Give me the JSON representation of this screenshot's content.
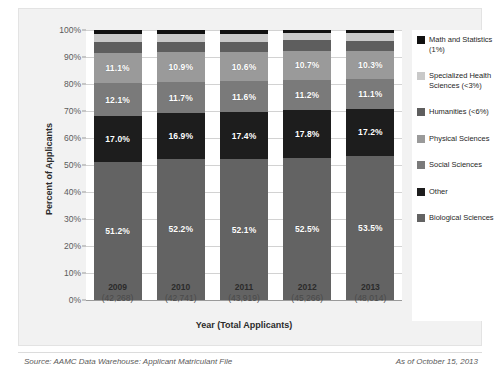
{
  "title_sliver": "",
  "footer": {
    "source": "Source: AAMC Data Warehouse: Applicant Matriculant File",
    "as_of": "As of October 15, 2013"
  },
  "axes": {
    "ylabel": "Percent of Applicants",
    "xlabel": "Year (Total Applicants)",
    "yticks": [
      "100%",
      "90%",
      "80%",
      "70%",
      "60%",
      "50%",
      "40%",
      "30%",
      "20%",
      "10%",
      "0%"
    ]
  },
  "colors": {
    "math_statistics": "#111111",
    "specialized_health_sciences": "#c9c9c9",
    "humanities": "#5e5e5e",
    "physical_sciences": "#9a9a9a",
    "social_sciences": "#7a7a7a",
    "other": "#1d1d1d",
    "biological_sciences": "#636363",
    "plot_background": "#ffffff",
    "panel_background": "#f2f2f2"
  },
  "legend": {
    "items": [
      {
        "label": "Math and Statistics (1%)",
        "color": "#111111",
        "key": "math_statistics"
      },
      {
        "label": "Specialized Health Sciences (<3%)",
        "color": "#c9c9c9",
        "key": "specialized_health_sciences"
      },
      {
        "label": "Humanities (<6%)",
        "color": "#5e5e5e",
        "key": "humanities"
      },
      {
        "label": "Physical Sciences",
        "color": "#9a9a9a",
        "key": "physical_sciences"
      },
      {
        "label": "Social Sciences",
        "color": "#7a7a7a",
        "key": "social_sciences"
      },
      {
        "label": "Other",
        "color": "#1d1d1d",
        "key": "other"
      },
      {
        "label": "Biological Sciences",
        "color": "#636363",
        "key": "biological_sciences"
      }
    ]
  },
  "chart_data": {
    "type": "bar",
    "subtype": "stacked-100-percent",
    "title": "",
    "xlabel": "Year (Total Applicants)",
    "ylabel": "Percent of Applicants",
    "ylim": [
      0,
      100
    ],
    "ytick_step": 10,
    "grid": true,
    "legend_position": "right",
    "categories": [
      "2009",
      "2010",
      "2011",
      "2012",
      "2013"
    ],
    "category_sublabels": [
      "(42,268)",
      "(42,741)",
      "(43,919)",
      "(45,266)",
      "(48,014)"
    ],
    "total_applicants": [
      42268,
      42741,
      43919,
      45266,
      48014
    ],
    "stack_order_bottom_to_top": [
      "Biological Sciences",
      "Other",
      "Social Sciences",
      "Physical Sciences",
      "Humanities",
      "Specialized Health Sciences",
      "Math and Statistics"
    ],
    "series": [
      {
        "name": "Biological Sciences",
        "color": "#636363",
        "values": [
          51.2,
          52.2,
          52.1,
          52.5,
          53.5
        ],
        "labeled": true,
        "labels": [
          "51.2%",
          "52.2%",
          "52.1%",
          "52.5%",
          "53.5%"
        ]
      },
      {
        "name": "Other",
        "color": "#1d1d1d",
        "values": [
          17.0,
          16.9,
          17.4,
          17.8,
          17.2
        ],
        "labeled": true,
        "labels": [
          "17.0%",
          "16.9%",
          "17.4%",
          "17.8%",
          "17.2%"
        ]
      },
      {
        "name": "Social Sciences",
        "color": "#7a7a7a",
        "values": [
          12.1,
          11.7,
          11.6,
          11.2,
          11.1
        ],
        "labeled": true,
        "labels": [
          "12.1%",
          "11.7%",
          "11.6%",
          "11.2%",
          "11.1%"
        ]
      },
      {
        "name": "Physical Sciences",
        "color": "#9a9a9a",
        "values": [
          11.1,
          10.9,
          10.6,
          10.7,
          10.3
        ],
        "labeled": true,
        "labels": [
          "11.1%",
          "10.9%",
          "10.6%",
          "10.7%",
          "10.3%"
        ]
      },
      {
        "name": "Humanities",
        "color": "#5e5e5e",
        "values": [
          4.0,
          4.0,
          4.0,
          4.0,
          4.0
        ],
        "labeled": false,
        "note": "<6%"
      },
      {
        "name": "Specialized Health Sciences",
        "color": "#c9c9c9",
        "values": [
          3.0,
          3.0,
          2.9,
          2.8,
          2.9
        ],
        "labeled": false,
        "note": "<3%"
      },
      {
        "name": "Math and Statistics",
        "color": "#111111",
        "values": [
          1.6,
          1.3,
          1.4,
          1.0,
          1.0
        ],
        "labeled": false,
        "note": "1%"
      }
    ]
  }
}
